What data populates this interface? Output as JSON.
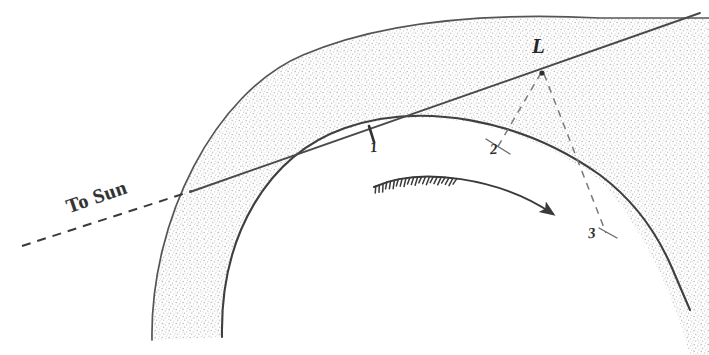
{
  "figure": {
    "kind": "astronomical-diagram",
    "background_color": "#ffffff",
    "ink_color": "#3a3a3a",
    "stipple_color": "#b9b9b9",
    "width": 709,
    "height": 355
  },
  "labels": {
    "sun_direction": "To Sun",
    "comet_head": "L",
    "point_1": "1",
    "point_2": "2",
    "point_3": "3"
  },
  "elements": {
    "outer_arc_name": "outer tail boundary arc",
    "inner_arc_name": "inner tail boundary arc",
    "stippled_band_name": "stippled tail band",
    "sun_line_name": "line to sun through nucleus",
    "dashed_ray_2_name": "dashed ray from L to point 2",
    "dashed_ray_3_name": "dashed ray from L to point 3",
    "motion_arrow_name": "curved motion arrow",
    "tick_1_name": "tick mark at point 1"
  },
  "geometry": {
    "outer_arc_path": "M 152 340 C 150 220 215 92 303 55 C 380 22 480 12 600 18 L 709 18",
    "inner_arc_path": "M 222 337 C 220 235 268 155 345 128 C 420 102 520 118 600 175 C 640 205 660 240 672 268 L 690 310",
    "band_fill_path": "M 152 340 C 150 220 215 92 303 55 C 380 22 480 12 600 18 L 709 18 L 709 355 L 690 355 C 676 300 640 222 600 180 C 520 120 420 104 345 130 C 268 157 221 236 222 337 Z",
    "sun_line_solid": "M 190 192 L 700 13",
    "sun_line_dashed": "M 22 246 L 192 191",
    "dashed_L_to_2": "M 541 73 L 497 148",
    "dashed_L_to_3": "M 544 74 L 606 233",
    "motion_arrow_path": "M 374 187 C 420 166 500 178 553 214",
    "tick_1_path": "M 369 126 L 374 142",
    "tick_2_path": "M 486 139 L 510 154",
    "tick_3_path": "M 599 228 L 617 238"
  },
  "positions": {
    "sun_label": {
      "left": 70,
      "top": 196
    },
    "L_label": {
      "left": 532,
      "top": 36
    },
    "n1_label": {
      "left": 370,
      "top": 140
    },
    "n2_label": {
      "left": 490,
      "top": 142
    },
    "n3_label": {
      "left": 588,
      "top": 226
    }
  }
}
